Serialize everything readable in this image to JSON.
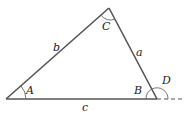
{
  "diagram": {
    "type": "triangle",
    "vertices": {
      "A": {
        "x": 6,
        "y": 99
      },
      "B": {
        "x": 157,
        "y": 99
      },
      "C": {
        "x": 109,
        "y": 8
      }
    },
    "angle_labels": {
      "A": "A",
      "B": "B",
      "C": "C",
      "D": "D"
    },
    "side_labels": {
      "a": "a",
      "b": "b",
      "c": "c"
    },
    "line_color": "#555555",
    "extension": "dashed line from B extending right (exterior angle D)"
  }
}
